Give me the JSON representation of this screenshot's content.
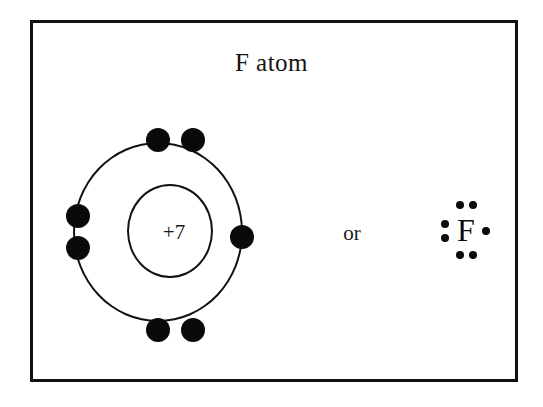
{
  "figure": {
    "title": "F atom",
    "background_color": "#ffffff",
    "line_color": "#121212",
    "border_color": "#111111"
  },
  "bohr_model": {
    "name": "bohr-diagram-fluorine",
    "nucleus_label": "+7",
    "nucleus_charge": 7,
    "shells": [
      {
        "index": 1,
        "name": "nucleus",
        "label": "+7",
        "electron_count": 0
      },
      {
        "index": 2,
        "name": "valence-shell",
        "electron_count": 7,
        "electrons": [
          {
            "position": "top-left",
            "label": "electron"
          },
          {
            "position": "top-right",
            "label": "electron"
          },
          {
            "position": "left-upper",
            "label": "electron"
          },
          {
            "position": "left-lower",
            "label": "electron"
          },
          {
            "position": "right",
            "label": "electron"
          },
          {
            "position": "bottom-left",
            "label": "electron"
          },
          {
            "position": "bottom-right",
            "label": "electron"
          }
        ]
      }
    ]
  },
  "connector": {
    "label": "or"
  },
  "lewis_structure": {
    "name": "lewis-dot-fluorine",
    "element_symbol": "F",
    "valence_electrons": 7,
    "dots": [
      {
        "position": "top-a",
        "label": "valence-dot"
      },
      {
        "position": "top-b",
        "label": "valence-dot"
      },
      {
        "position": "bottom-a",
        "label": "valence-dot"
      },
      {
        "position": "bottom-b",
        "label": "valence-dot"
      },
      {
        "position": "left-a",
        "label": "valence-dot"
      },
      {
        "position": "left-b",
        "label": "valence-dot"
      },
      {
        "position": "right-a",
        "label": "valence-dot"
      }
    ]
  }
}
